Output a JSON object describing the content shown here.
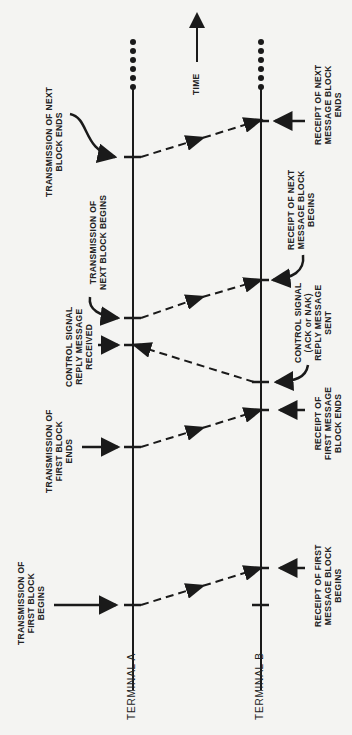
{
  "diagram": {
    "time_label": "TIME",
    "terminals": [
      {
        "name": "TERMINAL A"
      },
      {
        "name": "TERMINAL B"
      }
    ],
    "labels_a": [
      {
        "id": "tx-next-ends",
        "lines": [
          "TRANSMISSION OF NEXT",
          "BLOCK ENDS"
        ]
      },
      {
        "id": "tx-next-begins",
        "lines": [
          "TRANSMISSION OF",
          "NEXT BLOCK BEGINS"
        ]
      },
      {
        "id": "ctrl-received",
        "lines": [
          "CONTROL SIGNAL",
          "REPLY MESSAGE",
          "RECEIVED"
        ]
      },
      {
        "id": "tx-first-ends",
        "lines": [
          "TRANSMISSION OF",
          "FIRST BLOCK",
          "ENDS"
        ]
      },
      {
        "id": "tx-first-begins",
        "lines": [
          "TRANSMISSION OF",
          "FIRST BLOCK",
          "BEGINS"
        ]
      }
    ],
    "labels_b": [
      {
        "id": "rx-next-ends",
        "lines": [
          "RECEIPT OF NEXT",
          "MESSAGE BLOCK",
          "ENDS"
        ]
      },
      {
        "id": "rx-next-begins",
        "lines": [
          "RECEIPT OF NEXT",
          "MESSAGE BLOCK",
          "BEGINS"
        ]
      },
      {
        "id": "ctrl-sent",
        "lines": [
          "CONTROL SIGNAL",
          "(ACK or NAK)",
          "REPLY MESSAGE",
          "SENT"
        ]
      },
      {
        "id": "rx-first-ends",
        "lines": [
          "RECEIPT OF",
          "FIRST MESSAGE",
          "BLOCK ENDS"
        ]
      },
      {
        "id": "rx-first-begins",
        "lines": [
          "RECEIPT OF FIRST",
          "MESSAGE BLOCK",
          "BEGINS"
        ]
      }
    ],
    "colors": {
      "ink": "#1a1a1a",
      "background": "#f4f4f2"
    }
  }
}
